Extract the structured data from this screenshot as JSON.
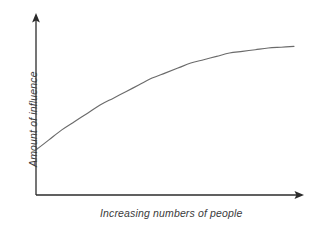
{
  "figure": {
    "background_color": "#ffffff",
    "axis_color": "#2b2b2b",
    "curve_color": "#6b6b6b",
    "text_color": "#3b3b3b"
  },
  "chart_data": {
    "type": "line",
    "title": "",
    "xlabel": "Increasing numbers of people",
    "ylabel": "Amount of influence",
    "grid": false,
    "legend": null,
    "annotations": [],
    "xlim": [
      0,
      1
    ],
    "ylim": [
      0,
      1
    ],
    "xticklabels": [],
    "yticklabels": [],
    "axis_arrows": {
      "x": "right",
      "y": "up"
    },
    "series": [
      {
        "name": "influence",
        "shape": "concave-increasing-saturating",
        "x": [
          0.0,
          0.05,
          0.1,
          0.15,
          0.2,
          0.25,
          0.3,
          0.35,
          0.4,
          0.45,
          0.5,
          0.55,
          0.6,
          0.65,
          0.7,
          0.75,
          0.8,
          0.85,
          0.9,
          0.95,
          1.0
        ],
        "y": [
          0.27,
          0.33,
          0.39,
          0.44,
          0.49,
          0.54,
          0.58,
          0.62,
          0.66,
          0.7,
          0.73,
          0.76,
          0.79,
          0.81,
          0.83,
          0.85,
          0.86,
          0.87,
          0.88,
          0.885,
          0.89
        ]
      }
    ]
  }
}
